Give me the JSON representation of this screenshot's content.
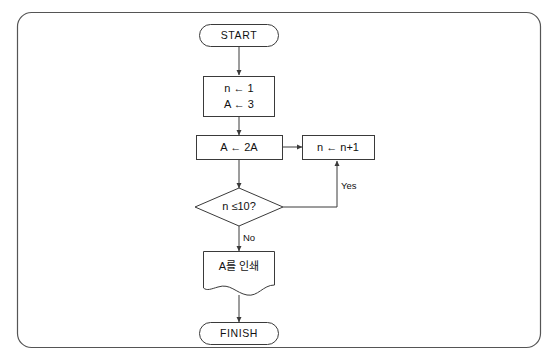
{
  "diagram": {
    "type": "flowchart",
    "border_color": "#555555",
    "stroke_color": "#3a3a3a",
    "background": "#ffffff",
    "nodes": [
      {
        "id": "start",
        "shape": "terminator",
        "label": "START"
      },
      {
        "id": "init",
        "shape": "process",
        "line1": "n ← 1",
        "line2": "A ← 3"
      },
      {
        "id": "double",
        "shape": "process",
        "label": "A ← 2A"
      },
      {
        "id": "increment",
        "shape": "process",
        "label": "n ← n+1"
      },
      {
        "id": "decision",
        "shape": "decision",
        "label": "n ≤10?"
      },
      {
        "id": "print",
        "shape": "document",
        "label": "A를 인쇄"
      },
      {
        "id": "finish",
        "shape": "terminator",
        "label": "FINISH"
      }
    ],
    "edges": [
      {
        "id": "start-to-init",
        "from": "start",
        "to": "init",
        "label": ""
      },
      {
        "id": "init-to-double",
        "from": "init",
        "to": "double",
        "label": ""
      },
      {
        "id": "double-to-increment",
        "from": "double",
        "to": "increment",
        "label": ""
      },
      {
        "id": "double-to-decision",
        "from": "double",
        "to": "decision",
        "label": ""
      },
      {
        "id": "decision-yes",
        "from": "decision",
        "to": "increment",
        "label": "Yes"
      },
      {
        "id": "decision-no",
        "from": "decision",
        "to": "print",
        "label": "No"
      },
      {
        "id": "print-to-finish",
        "from": "print",
        "to": "finish",
        "label": ""
      }
    ],
    "labels": {
      "yes": "Yes",
      "no": "No"
    }
  }
}
